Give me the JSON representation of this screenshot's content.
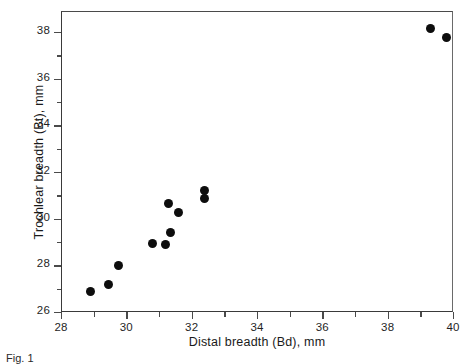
{
  "chart_data": {
    "type": "scatter",
    "title": "",
    "xlabel": "Distal breadth (Bd), mm",
    "ylabel": "Trochlear breadth (Bt), mm",
    "xlim": [
      28,
      40
    ],
    "ylim": [
      26,
      38.9
    ],
    "x_major_ticks": [
      28,
      30,
      32,
      34,
      36,
      38,
      40
    ],
    "x_minor_ticks": [
      29,
      31,
      33,
      35,
      37,
      39
    ],
    "y_major_ticks": [
      26,
      28,
      30,
      32,
      34,
      36,
      38
    ],
    "y_minor_ticks": [
      27,
      29,
      31,
      33,
      35,
      37
    ],
    "x_tick_labels": [
      "28",
      "30",
      "32",
      "34",
      "36",
      "38",
      "40"
    ],
    "y_tick_labels": [
      "26",
      "28",
      "30",
      "32",
      "34",
      "36",
      "38"
    ],
    "grid": false,
    "legend": "none",
    "marker": {
      "shape": "circle",
      "color": "#0d0d0d",
      "size_px": 9
    },
    "points": [
      {
        "x": 28.9,
        "y": 26.9
      },
      {
        "x": 29.45,
        "y": 27.2
      },
      {
        "x": 29.75,
        "y": 28.0
      },
      {
        "x": 30.8,
        "y": 28.95
      },
      {
        "x": 31.2,
        "y": 28.9
      },
      {
        "x": 31.35,
        "y": 29.4
      },
      {
        "x": 31.3,
        "y": 30.65
      },
      {
        "x": 31.6,
        "y": 30.25
      },
      {
        "x": 32.4,
        "y": 31.2
      },
      {
        "x": 32.4,
        "y": 30.85
      },
      {
        "x": 39.3,
        "y": 38.15
      },
      {
        "x": 39.8,
        "y": 37.75
      }
    ]
  },
  "caption": {
    "text": "Fig. 1"
  }
}
